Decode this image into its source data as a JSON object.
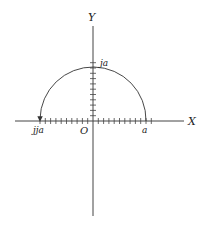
{
  "diagram": {
    "type": "complex-plane rotation",
    "colors": {
      "ink": "#333333",
      "background": "#ffffff"
    },
    "axes": {
      "x_label": "X",
      "y_label": "Y",
      "origin_label": "O"
    },
    "points": {
      "real": "a",
      "imag": "ja",
      "neg_real": "jja"
    },
    "arc": {
      "from": "a",
      "through": "ja",
      "to": "jja",
      "direction": "counter-clockwise",
      "arrowhead": "at jja"
    }
  }
}
